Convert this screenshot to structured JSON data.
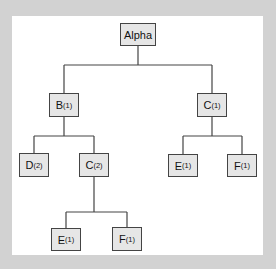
{
  "diagram": {
    "type": "tree",
    "colors": {
      "background": "#d2d2d2",
      "panel": "#ffffff",
      "node_fill": "#e6e6e6",
      "node_border": "#444444",
      "edge": "#444444"
    },
    "nodes": [
      {
        "id": "alpha",
        "label": "Alpha",
        "sub": "",
        "x": 120,
        "y": 23,
        "w": 36,
        "h": 23
      },
      {
        "id": "b1",
        "label": "B",
        "sub": "(1)",
        "x": 49,
        "y": 93,
        "w": 30,
        "h": 24
      },
      {
        "id": "c1",
        "label": "C",
        "sub": "(1)",
        "x": 197,
        "y": 93,
        "w": 30,
        "h": 24
      },
      {
        "id": "d2",
        "label": "D",
        "sub": "(2)",
        "x": 19,
        "y": 153,
        "w": 30,
        "h": 24
      },
      {
        "id": "c2",
        "label": "C",
        "sub": "(2)",
        "x": 79,
        "y": 153,
        "w": 30,
        "h": 24
      },
      {
        "id": "e1r",
        "label": "E",
        "sub": "(1)",
        "x": 168,
        "y": 154,
        "w": 30,
        "h": 23
      },
      {
        "id": "f1r",
        "label": "F",
        "sub": "(1)",
        "x": 227,
        "y": 154,
        "w": 30,
        "h": 23
      },
      {
        "id": "e1b",
        "label": "E",
        "sub": "(1)",
        "x": 51,
        "y": 228,
        "w": 30,
        "h": 23
      },
      {
        "id": "f1b",
        "label": "F",
        "sub": "(1)",
        "x": 112,
        "y": 227,
        "w": 30,
        "h": 24
      }
    ],
    "edges": [
      [
        "alpha",
        "b1"
      ],
      [
        "alpha",
        "c1"
      ],
      [
        "b1",
        "d2"
      ],
      [
        "b1",
        "c2"
      ],
      [
        "c1",
        "e1r"
      ],
      [
        "c1",
        "f1r"
      ],
      [
        "c2",
        "e1b"
      ],
      [
        "c2",
        "f1b"
      ]
    ]
  }
}
